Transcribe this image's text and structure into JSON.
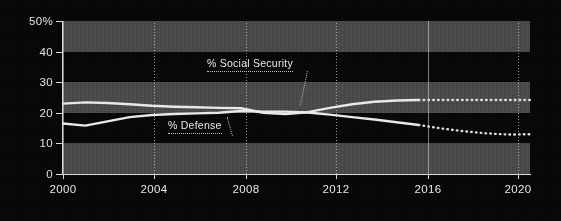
{
  "chart_data": {
    "type": "line",
    "title": "",
    "xlabel": "",
    "ylabel": "",
    "xlim": [
      2000,
      2021
    ],
    "ylim": [
      0,
      50
    ],
    "yticks": [
      0,
      10,
      20,
      30,
      40,
      50
    ],
    "ytick_labels": [
      "0",
      "10",
      "20",
      "30",
      "40",
      "50%"
    ],
    "xticks": [
      2000,
      2004,
      2008,
      2012,
      2016,
      2020
    ],
    "xtick_labels": [
      "2000",
      "2004",
      "2008",
      "2012",
      "2016",
      "2020"
    ],
    "grid": "vertical dotted at xticks; horizontal alternating shaded bands every 10 units",
    "legend": "inline annotations with dotted underline and leader lines",
    "x": [
      2000,
      2001,
      2002,
      2003,
      2004,
      2005,
      2006,
      2007,
      2008,
      2009,
      2010,
      2011,
      2012,
      2013,
      2014,
      2015,
      2016,
      2017,
      2018,
      2019,
      2020,
      2021
    ],
    "series": [
      {
        "name": "% Social Security",
        "label": "% Social Security",
        "color": "#e8e8e8",
        "style": "solid through 2016, dotted projection 2016-2021",
        "solid_through": 2016,
        "values": [
          23.0,
          23.4,
          23.2,
          22.8,
          22.3,
          22.0,
          21.8,
          21.6,
          21.5,
          20.0,
          19.6,
          20.2,
          21.6,
          22.8,
          23.6,
          24.0,
          24.2,
          24.2,
          24.2,
          24.2,
          24.2,
          24.2
        ]
      },
      {
        "name": "% Defense",
        "label": "% Defense",
        "color": "#e8e8e8",
        "style": "solid through 2016, dotted projection 2016-2021",
        "solid_through": 2016,
        "values": [
          16.5,
          15.8,
          17.2,
          18.6,
          19.3,
          19.6,
          19.8,
          20.0,
          20.6,
          20.4,
          20.4,
          20.1,
          19.4,
          18.6,
          17.8,
          16.9,
          16.0,
          14.9,
          14.0,
          13.3,
          12.9,
          13.0
        ]
      }
    ],
    "annotations": [
      {
        "text": "% Social Security",
        "x_frac": 0.36,
        "y_value": 33.5
      },
      {
        "text": "% Defense",
        "x_frac": 0.25,
        "y_value": 13.5
      }
    ]
  },
  "axis": {
    "y_labels": [
      "50%",
      "40",
      "30",
      "20",
      "10",
      "0"
    ],
    "x_labels": [
      "2000",
      "2004",
      "2008",
      "2012",
      "2016",
      "2020"
    ]
  },
  "labels": {
    "social_security": "% Social Security",
    "defense": "% Defense"
  },
  "colors": {
    "background": "#050505",
    "band": "#4a4a4a",
    "line": "#e8e8e8",
    "axis": "#d9d9d9",
    "text": "#e6e6e6"
  }
}
